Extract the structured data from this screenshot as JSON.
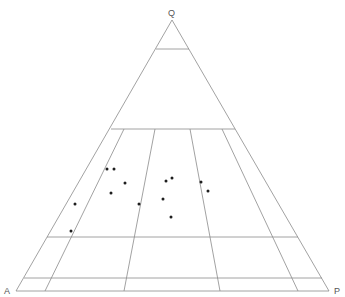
{
  "diagram": {
    "type": "ternary",
    "colors": {
      "background": "#ffffff",
      "line": "#8a8a8a",
      "point": "#1e1e1e",
      "label": "#555555"
    },
    "vertices": {
      "top": {
        "label": "Q",
        "x": 172,
        "y": 20,
        "label_x": 168,
        "label_y": 9
      },
      "left": {
        "label": "A",
        "x": 16,
        "y": 291,
        "label_x": 4,
        "label_y": 287
      },
      "right": {
        "label": "P",
        "x": 329,
        "y": 291,
        "label_x": 334,
        "label_y": 287
      }
    },
    "horizontal_lines": [
      {
        "y": 49,
        "x1": 156,
        "x2": 189
      },
      {
        "y": 129,
        "x1": 111,
        "x2": 235
      },
      {
        "y": 237,
        "x1": 47,
        "x2": 298
      },
      {
        "y": 278,
        "x1": 24,
        "x2": 322
      }
    ],
    "field_lines": [
      {
        "x1": 124,
        "y1": 129,
        "x2": 45,
        "y2": 291
      },
      {
        "x1": 155,
        "y1": 129,
        "x2": 124,
        "y2": 291
      },
      {
        "x1": 190,
        "y1": 129,
        "x2": 220,
        "y2": 291
      },
      {
        "x1": 222,
        "y1": 129,
        "x2": 298,
        "y2": 291
      }
    ],
    "points": [
      {
        "x": 107,
        "y": 169
      },
      {
        "x": 114,
        "y": 169
      },
      {
        "x": 125,
        "y": 183
      },
      {
        "x": 111,
        "y": 193
      },
      {
        "x": 75,
        "y": 204
      },
      {
        "x": 139,
        "y": 204
      },
      {
        "x": 71,
        "y": 231
      },
      {
        "x": 166,
        "y": 181
      },
      {
        "x": 172,
        "y": 178
      },
      {
        "x": 163,
        "y": 199
      },
      {
        "x": 171,
        "y": 217
      },
      {
        "x": 201,
        "y": 182
      },
      {
        "x": 208,
        "y": 191
      }
    ]
  }
}
